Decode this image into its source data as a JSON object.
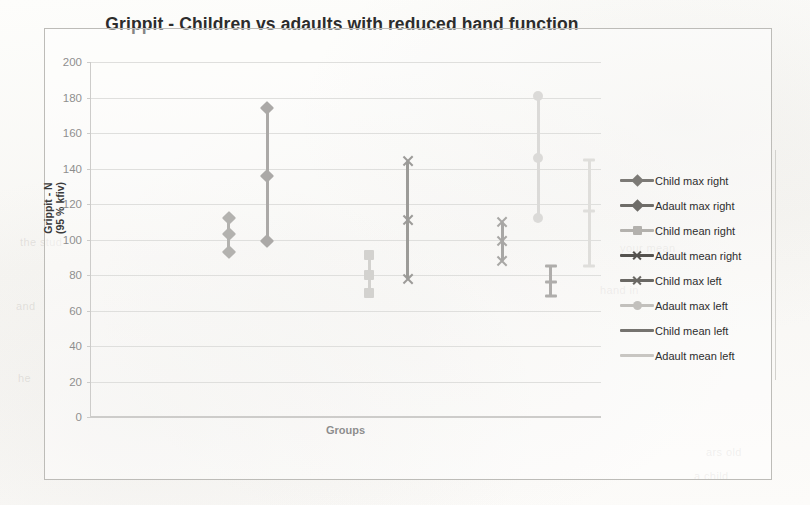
{
  "chart_data": {
    "type": "scatter",
    "title": "Grippit - Children vs adaults with reduced hand function",
    "xlabel": "Groups",
    "ylabel": "Grippit - N\n(95 % kfiv)",
    "ylabel_line1": "Grippit - N",
    "ylabel_line2": "(95 % kfiv)",
    "ylim": [
      0,
      200
    ],
    "ytick_step": 20,
    "yticks": [
      200,
      180,
      160,
      140,
      120,
      100,
      80,
      60,
      40,
      20,
      0
    ],
    "grid": true,
    "legend_position": "right",
    "note": "Each series is drawn as a vertical line spanning the 95% confidence interval with markers at lower bound, mean and upper bound.",
    "series": [
      {
        "name": "Child max right",
        "color": "#7c7a76",
        "marker": "diamond",
        "x_pos": 0.27,
        "lower": 93,
        "mean": 103,
        "upper": 112,
        "values": [
          93,
          103,
          112
        ]
      },
      {
        "name": "Adault max right",
        "color": "#6e6c68",
        "marker": "diamond",
        "x_pos": 0.345,
        "lower": 99,
        "mean": 136,
        "upper": 174,
        "values": [
          99,
          136,
          174
        ]
      },
      {
        "name": "Child mean right",
        "color": "#b3b1ad",
        "marker": "square",
        "x_pos": 0.545,
        "lower": 70,
        "mean": 80,
        "upper": 91,
        "values": [
          70,
          80,
          91
        ]
      },
      {
        "name": "Adault mean right",
        "color": "#55534f",
        "marker": "cross",
        "x_pos": 0.62,
        "lower": 78,
        "mean": 111,
        "upper": 144,
        "values": [
          78,
          111,
          144
        ]
      },
      {
        "name": "Child max left",
        "color": "#6a6864",
        "marker": "cross",
        "x_pos": 0.805,
        "lower": 88,
        "mean": 99,
        "upper": 110,
        "values": [
          88,
          99,
          110
        ]
      },
      {
        "name": "Adault max left",
        "color": "#c2c0bc",
        "marker": "circle",
        "x_pos": 0.875,
        "lower": 112,
        "mean": 146,
        "upper": 181,
        "values": [
          112,
          146,
          181
        ]
      },
      {
        "name": "Child mean left",
        "color": "#75736f",
        "marker": "dash",
        "x_pos": 0.9,
        "lower": 68,
        "mean": 76,
        "upper": 85,
        "values": [
          68,
          76,
          85
        ]
      },
      {
        "name": "Adault mean left",
        "color": "#c8c6c2",
        "marker": "dash",
        "x_pos": 0.975,
        "lower": 85,
        "mean": 116,
        "upper": 145,
        "values": [
          85,
          116,
          145
        ]
      }
    ]
  },
  "chart": {
    "title": "Grippit - Children vs adaults with reduced hand function",
    "x_axis_title": "Groups",
    "y_axis_title_line1": "Grippit - N",
    "y_axis_title_line2": "(95 % kfiv)"
  },
  "legend": {
    "items": [
      {
        "label": "Child max right",
        "color": "#7c7a76",
        "marker": "diamond"
      },
      {
        "label": "Adault max right",
        "color": "#6e6c68",
        "marker": "diamond"
      },
      {
        "label": "Child mean right",
        "color": "#b3b1ad",
        "marker": "square"
      },
      {
        "label": "Adault mean right",
        "color": "#55534f",
        "marker": "cross"
      },
      {
        "label": "Child max left",
        "color": "#6a6864",
        "marker": "cross"
      },
      {
        "label": "Adault max left",
        "color": "#c2c0bc",
        "marker": "circle"
      },
      {
        "label": "Child mean left",
        "color": "#75736f",
        "marker": "dash"
      },
      {
        "label": "Adault mean left",
        "color": "#c8c6c2",
        "marker": "dash"
      }
    ]
  },
  "colors": {
    "page_background": "#fbfbf9",
    "frame_border": "#bdbcb8",
    "gridline": "#c9c8c4",
    "axis": "#a9a8a4",
    "text": "#2c2c2c"
  }
}
